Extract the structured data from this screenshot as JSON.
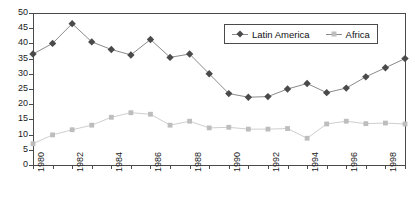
{
  "chart_data": {
    "type": "line",
    "title": "",
    "xlabel": "",
    "ylabel": "",
    "x": [
      1980,
      1981,
      1982,
      1983,
      1984,
      1985,
      1986,
      1987,
      1988,
      1989,
      1990,
      1991,
      1992,
      1993,
      1994,
      1995,
      1996,
      1997,
      1998,
      1999
    ],
    "xtick_labels": [
      "1980",
      "1982",
      "1984",
      "1986",
      "1988",
      "1990",
      "1992",
      "1994",
      "1996",
      "1998"
    ],
    "xtick_values": [
      1980,
      1982,
      1984,
      1986,
      1988,
      1990,
      1992,
      1994,
      1996,
      1998
    ],
    "ytick_labels": [
      "0",
      "5",
      "10",
      "15",
      "20",
      "25",
      "30",
      "35",
      "40",
      "45",
      "50"
    ],
    "ytick_values": [
      0,
      5,
      10,
      15,
      20,
      25,
      30,
      35,
      40,
      45,
      50
    ],
    "ylim": [
      0,
      50
    ],
    "xlim": [
      1980,
      1999
    ],
    "grid": false,
    "legend_position": "top-right",
    "series": [
      {
        "name": "Latin America",
        "marker": "diamond",
        "color": "#4a4a4a",
        "line_color": "#8a8a8a",
        "values": [
          36.5,
          40.0,
          46.5,
          40.5,
          38.0,
          36.2,
          41.3,
          35.4,
          36.5,
          30.0,
          23.5,
          22.3,
          22.5,
          25.0,
          26.8,
          23.8,
          25.3,
          29.0,
          32.0,
          35.0
        ]
      },
      {
        "name": "Africa",
        "marker": "square",
        "color": "#bdbdbd",
        "line_color": "#cfcfcf",
        "values": [
          7.0,
          9.9,
          11.6,
          13.1,
          15.7,
          17.2,
          16.7,
          13.1,
          14.4,
          12.2,
          12.4,
          11.8,
          11.8,
          12.0,
          8.8,
          13.5,
          14.4,
          13.6,
          13.8,
          13.5
        ]
      }
    ]
  },
  "legend": {
    "items": [
      {
        "label": "Latin America",
        "marker": "diamond"
      },
      {
        "label": "Africa",
        "marker": "square"
      }
    ]
  }
}
